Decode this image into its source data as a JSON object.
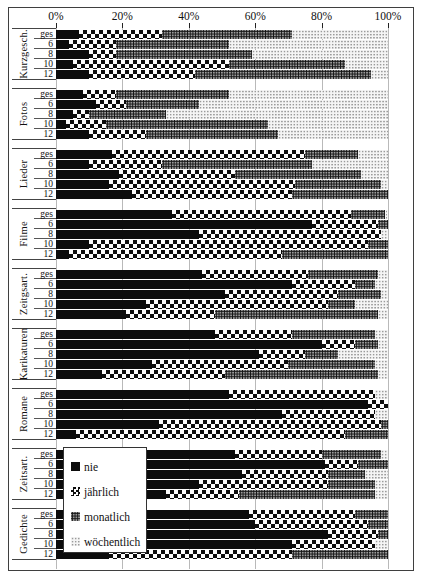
{
  "legend": {
    "items": [
      {
        "label": "nie",
        "pattern": "solid"
      },
      {
        "label": "jährlich",
        "pattern": "checker"
      },
      {
        "label": "monatlich",
        "pattern": "dots-dark"
      },
      {
        "label": "wöchentlich",
        "pattern": "dots-light"
      }
    ]
  },
  "chart_data": {
    "type": "bar",
    "orientation": "horizontal",
    "stacked": true,
    "unit": "%",
    "xlim": [
      0,
      100
    ],
    "axis_ticks": [
      "0%",
      "20%",
      "40%",
      "60%",
      "80%",
      "100%"
    ],
    "grid": true,
    "legend_position": "inside-bottom-left",
    "series_names": [
      "nie",
      "jährlich",
      "monatlich",
      "wöchentlich"
    ],
    "row_labels": [
      "ges",
      "6",
      "8",
      "10",
      "12"
    ],
    "groups": [
      {
        "label": "Kurzgesch.",
        "rows": [
          {
            "label": "ges",
            "values": [
              7,
              25,
              39,
              29
            ]
          },
          {
            "label": "6",
            "values": [
              4,
              14,
              34,
              48
            ]
          },
          {
            "label": "8",
            "values": [
              10,
              8,
              41,
              41
            ]
          },
          {
            "label": "10",
            "values": [
              5,
              47,
              35,
              13
            ]
          },
          {
            "label": "12",
            "values": [
              10,
              32,
              53,
              5
            ]
          }
        ]
      },
      {
        "label": "Fotos",
        "rows": [
          {
            "label": "ges",
            "values": [
              8,
              10,
              34,
              48
            ]
          },
          {
            "label": "6",
            "values": [
              12,
              9,
              22,
              57
            ]
          },
          {
            "label": "8",
            "values": [
              5,
              5,
              23,
              67
            ]
          },
          {
            "label": "10",
            "values": [
              3,
              12,
              49,
              36
            ]
          },
          {
            "label": "12",
            "values": [
              10,
              17,
              40,
              33
            ]
          }
        ]
      },
      {
        "label": "Lieder",
        "rows": [
          {
            "label": "ges",
            "values": [
              17,
              58,
              16,
              9
            ]
          },
          {
            "label": "6",
            "values": [
              10,
              22,
              45,
              23
            ]
          },
          {
            "label": "8",
            "values": [
              19,
              35,
              38,
              8
            ]
          },
          {
            "label": "10",
            "values": [
              16,
              56,
              26,
              2
            ]
          },
          {
            "label": "12",
            "values": [
              23,
              48,
              29,
              0
            ]
          }
        ]
      },
      {
        "label": "Filme",
        "rows": [
          {
            "label": "ges",
            "values": [
              35,
              54,
              10,
              1
            ]
          },
          {
            "label": "6",
            "values": [
              77,
              20,
              3,
              0
            ]
          },
          {
            "label": "8",
            "values": [
              43,
              55,
              0,
              2
            ]
          },
          {
            "label": "10",
            "values": [
              10,
              84,
              6,
              0
            ]
          },
          {
            "label": "12",
            "values": [
              4,
              64,
              32,
              0
            ]
          }
        ]
      },
      {
        "label": "Zeitgsart.",
        "rows": [
          {
            "label": "ges",
            "values": [
              44,
              32,
              21,
              3
            ]
          },
          {
            "label": "6",
            "values": [
              71,
              19,
              6,
              4
            ]
          },
          {
            "label": "8",
            "values": [
              51,
              34,
              13,
              2
            ]
          },
          {
            "label": "10",
            "values": [
              27,
              55,
              8,
              10
            ]
          },
          {
            "label": "12",
            "values": [
              21,
              27,
              49,
              3
            ]
          }
        ]
      },
      {
        "label": "Karikaturen",
        "rows": [
          {
            "label": "ges",
            "values": [
              48,
              23,
              25,
              4
            ]
          },
          {
            "label": "6",
            "values": [
              80,
              10,
              7,
              3
            ]
          },
          {
            "label": "8",
            "values": [
              61,
              14,
              10,
              15
            ]
          },
          {
            "label": "10",
            "values": [
              29,
              41,
              26,
              4
            ]
          },
          {
            "label": "12",
            "values": [
              14,
              37,
              46,
              3
            ]
          }
        ]
      },
      {
        "label": "Romane",
        "rows": [
          {
            "label": "ges",
            "values": [
              52,
              44,
              0,
              4
            ]
          },
          {
            "label": "6",
            "values": [
              94,
              6,
              0,
              0
            ]
          },
          {
            "label": "8",
            "values": [
              68,
              28,
              0,
              4
            ]
          },
          {
            "label": "10",
            "values": [
              31,
              67,
              2,
              0
            ]
          },
          {
            "label": "12",
            "values": [
              6,
              81,
              13,
              0
            ]
          }
        ]
      },
      {
        "label": "Zeitsart.",
        "rows": [
          {
            "label": "ges",
            "values": [
              54,
              26,
              18,
              2
            ]
          },
          {
            "label": "6",
            "values": [
              81,
              10,
              9,
              0
            ]
          },
          {
            "label": "8",
            "values": [
              56,
              26,
              11,
              7
            ]
          },
          {
            "label": "10",
            "values": [
              43,
              39,
              14,
              4
            ]
          },
          {
            "label": "12",
            "values": [
              33,
              22,
              41,
              4
            ]
          }
        ]
      },
      {
        "label": "Gedichte",
        "rows": [
          {
            "label": "ges",
            "values": [
              58,
              32,
              10,
              0
            ]
          },
          {
            "label": "6",
            "values": [
              60,
              34,
              6,
              0
            ]
          },
          {
            "label": "8",
            "values": [
              82,
              15,
              3,
              0
            ]
          },
          {
            "label": "10",
            "values": [
              71,
              25,
              0,
              4
            ]
          },
          {
            "label": "12",
            "values": [
              16,
              55,
              29,
              0
            ]
          }
        ]
      }
    ]
  }
}
